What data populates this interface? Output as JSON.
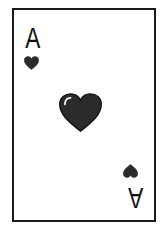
{
  "card": {
    "rank": "A",
    "rank_bottom": "A",
    "suit": "heart-icon",
    "colors": {
      "border": "#1a1a1a",
      "background": "#ffffff",
      "suit_fill": "#2b2b2b",
      "text": "#111111"
    }
  }
}
